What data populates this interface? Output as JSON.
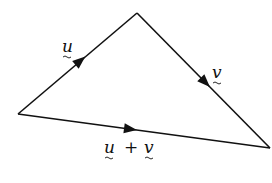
{
  "diagram": {
    "type": "vector-triangle",
    "vertices": {
      "start": {
        "x": 18,
        "y": 114
      },
      "apex": {
        "x": 137,
        "y": 13
      },
      "end": {
        "x": 270,
        "y": 148
      }
    },
    "edges": [
      {
        "id": "u",
        "from": "start",
        "to": "apex",
        "label": "u"
      },
      {
        "id": "v",
        "from": "apex",
        "to": "end",
        "label": "v"
      },
      {
        "id": "u_plus_v",
        "from": "start",
        "to": "end",
        "label_parts": [
          "u",
          "+",
          "v"
        ]
      }
    ],
    "labels": {
      "u": "u",
      "v": "v",
      "sum_u": "u",
      "sum_plus": "+",
      "sum_v": "v"
    },
    "colors": {
      "line": "#111111",
      "background": "#ffffff"
    }
  }
}
